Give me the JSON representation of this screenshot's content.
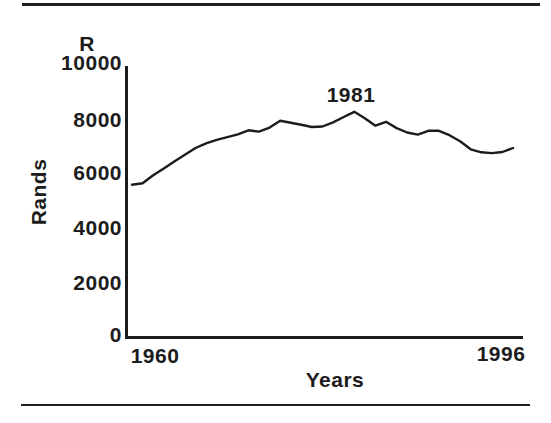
{
  "colors": {
    "ink": "#1c1c1c",
    "paper": "#ffffff"
  },
  "chart_data": {
    "type": "line",
    "title": "",
    "y_axis_unit_label": "R",
    "ylabel": "Rands",
    "xlabel": "Years",
    "ylim": [
      0,
      10000
    ],
    "xlim": [
      1960,
      1996
    ],
    "grid": false,
    "legend_position": "none",
    "line_color": "#1c1c1c",
    "y_tick_labels": [
      "10000",
      "8000",
      "6000",
      "4000",
      "2000",
      "0"
    ],
    "x_tick_labels": [
      "1960",
      "1996"
    ],
    "annotation": {
      "label": "1981",
      "year": 1981,
      "value": 8280
    },
    "series": [
      {
        "name": "Rands",
        "x": [
          1960,
          1961,
          1962,
          1963,
          1964,
          1965,
          1966,
          1967,
          1968,
          1969,
          1970,
          1971,
          1972,
          1973,
          1974,
          1975,
          1976,
          1977,
          1978,
          1979,
          1980,
          1981,
          1982,
          1983,
          1984,
          1985,
          1986,
          1987,
          1988,
          1989,
          1990,
          1991,
          1992,
          1993,
          1994,
          1995,
          1996
        ],
        "values": [
          5600,
          5650,
          5950,
          6200,
          6450,
          6700,
          6950,
          7120,
          7250,
          7350,
          7450,
          7600,
          7550,
          7700,
          7950,
          7880,
          7800,
          7720,
          7740,
          7890,
          8090,
          8280,
          8040,
          7770,
          7910,
          7680,
          7520,
          7440,
          7580,
          7580,
          7420,
          7200,
          6900,
          6790,
          6760,
          6800,
          6950
        ]
      }
    ]
  }
}
